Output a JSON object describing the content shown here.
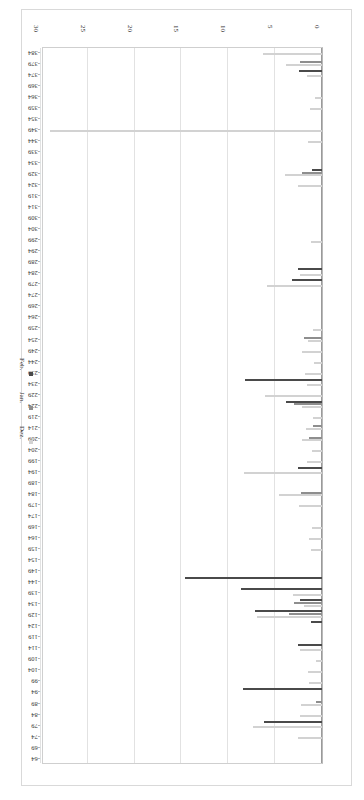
{
  "chart_data": {
    "type": "bar",
    "orientation": "horizontal",
    "title": "",
    "xlabel": "",
    "ylabel": "",
    "xlim": [
      0,
      30
    ],
    "xticks": [
      0,
      5,
      10,
      15,
      20,
      25,
      30
    ],
    "xtick_labels": [
      "0",
      "5",
      "10",
      "15",
      "20",
      "25",
      "30"
    ],
    "grid": true,
    "legend_position": "right",
    "legend": [
      "Dez.",
      "Jan.",
      "Feb."
    ],
    "series": [
      {
        "name": "Dez.",
        "color": "#d2d2d2"
      },
      {
        "name": "Jan.",
        "color": "#8e8e8e"
      },
      {
        "name": "Feb.",
        "color": "#4a4a4a"
      }
    ],
    "categories": [
      "-64",
      "-69",
      "-74",
      "-79",
      "-84",
      "-89",
      "-94",
      "-99",
      "-104",
      "-109",
      "-114",
      "-119",
      "-124",
      "-129",
      "-134",
      "-139",
      "-144",
      "-149",
      "-154",
      "-159",
      "-164",
      "-169",
      "-174",
      "-179",
      "-184",
      "-189",
      "-194",
      "-199",
      "-204",
      "-209",
      "-214",
      "-219",
      "-224",
      "-229",
      "-234",
      "-239",
      "-244",
      "-249",
      "-254",
      "-259",
      "-264",
      "-269",
      "-274",
      "-279",
      "-284",
      "-289",
      "-294",
      "-299",
      "-304",
      "-309",
      "-314",
      "-319",
      "-324",
      "-329",
      "-334",
      "-339",
      "-344",
      "-349",
      "-354",
      "-359",
      "-364",
      "-369",
      "-374",
      "-379",
      "-384"
    ],
    "values": {
      "Dez.": [
        0,
        0,
        2.6,
        7.4,
        2.3,
        2.2,
        0,
        1.4,
        1.5,
        0.6,
        2.4,
        0,
        0,
        6.9,
        1.9,
        3.1,
        0,
        0,
        0,
        1.2,
        1.4,
        1.1,
        0,
        2.5,
        4.6,
        0,
        8.3,
        1.6,
        1.1,
        2.1,
        1.7,
        1.0,
        2.1,
        6.1,
        1.6,
        1.8,
        0.9,
        2.1,
        1.5,
        1.0,
        0,
        0,
        0,
        5.9,
        2.4,
        0,
        0,
        1.2,
        0,
        0,
        0,
        0,
        2.6,
        4.0,
        0,
        0,
        1.5,
        29.0,
        0,
        1.3,
        0.7,
        0,
        1.6,
        3.8,
        6.3
      ],
      "Jan.": [
        0,
        0,
        0,
        0,
        0,
        0.6,
        0,
        0,
        0,
        0,
        0,
        0,
        0,
        3.5,
        3.0,
        0,
        0,
        0,
        0,
        0,
        0,
        0,
        0,
        0,
        2.2,
        0,
        0,
        0,
        0,
        1.4,
        1.0,
        0,
        3.0,
        0,
        0,
        0,
        0,
        0,
        1.9,
        0,
        0,
        0,
        0,
        0,
        0,
        0,
        0,
        0,
        0,
        0,
        0,
        0,
        0,
        2.1,
        0,
        0,
        0,
        0,
        0,
        0,
        0,
        0,
        0,
        2.3,
        0
      ],
      "Feb.": [
        0,
        0,
        0,
        6.2,
        0,
        0,
        8.4,
        0,
        0,
        0,
        2.6,
        0,
        1.2,
        7.1,
        2.4,
        8.6,
        14.6,
        0,
        0,
        0,
        0,
        0,
        0,
        0,
        0,
        0,
        2.6,
        0,
        0,
        0,
        0,
        0,
        3.8,
        0,
        8.2,
        0,
        0,
        0,
        0,
        0,
        0,
        0,
        0,
        3.2,
        2.6,
        0,
        0,
        0,
        0,
        0,
        0,
        0,
        0,
        1.1,
        0,
        0,
        0,
        0,
        0,
        0,
        0,
        0,
        2.5,
        0,
        0
      ]
    }
  },
  "axis": {
    "value_axis_name": "value-axis",
    "category_axis_name": "category-axis"
  }
}
